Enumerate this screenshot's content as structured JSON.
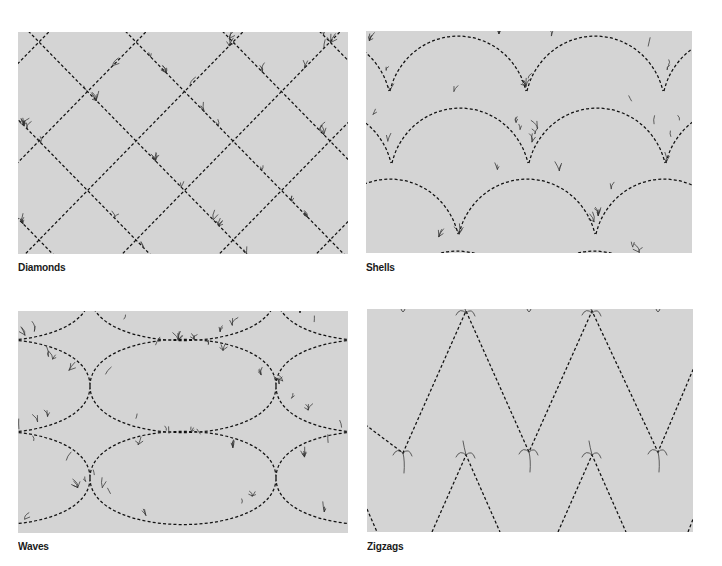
{
  "colors": {
    "panel_bg": "#d4d4d4",
    "stitch": "#111111",
    "page_bg": "#ffffff"
  },
  "figures": [
    {
      "id": "diamonds",
      "caption": "Diamonds",
      "pattern": "diamonds",
      "panel": {
        "x": 18,
        "y": 32,
        "w": 330,
        "h": 222
      },
      "caption_pos": {
        "x": 18,
        "y": 261
      }
    },
    {
      "id": "shells",
      "caption": "Shells",
      "pattern": "shells",
      "panel": {
        "x": 366,
        "y": 31,
        "w": 326,
        "h": 222
      },
      "caption_pos": {
        "x": 366,
        "y": 261
      }
    },
    {
      "id": "waves",
      "caption": "Waves",
      "pattern": "waves",
      "panel": {
        "x": 18,
        "y": 311,
        "w": 330,
        "h": 222
      },
      "caption_pos": {
        "x": 18,
        "y": 540
      }
    },
    {
      "id": "zigzags",
      "caption": "Zigzags",
      "pattern": "zigzags",
      "panel": {
        "x": 367,
        "y": 309,
        "w": 326,
        "h": 223
      },
      "caption_pos": {
        "x": 367,
        "y": 540
      }
    }
  ]
}
